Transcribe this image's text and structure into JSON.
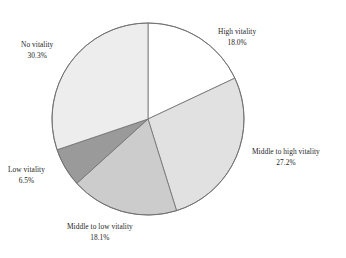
{
  "chart_data": {
    "type": "pie",
    "title": "",
    "subtitle": "",
    "legend_position": "none",
    "grid": false,
    "start_angle_deg": 0,
    "direction": "clockwise",
    "categories": [
      "High vitality",
      "Middle to high vitality",
      "Middle to low vitality",
      "Low vitality",
      "No vitality"
    ],
    "values": [
      18.0,
      27.2,
      18.1,
      6.5,
      30.3
    ],
    "value_unit": "%",
    "slices": [
      {
        "label": "High vitality",
        "percent_text": "18.0%",
        "value": 18.0,
        "color": "#ffffff",
        "start_deg": 0.0,
        "end_deg": 64.8
      },
      {
        "label": "Middle to high vitality",
        "percent_text": "27.2%",
        "value": 27.2,
        "color": "#e1e1e1",
        "start_deg": 64.8,
        "end_deg": 162.7
      },
      {
        "label": "Middle to low vitality",
        "percent_text": "18.1%",
        "value": 18.1,
        "color": "#cccccc",
        "start_deg": 162.7,
        "end_deg": 227.9
      },
      {
        "label": "Low vitality",
        "percent_text": "6.5%",
        "value": 6.5,
        "color": "#9a9a9a",
        "start_deg": 227.9,
        "end_deg": 251.3
      },
      {
        "label": "No vitality",
        "percent_text": "30.3%",
        "value": 30.3,
        "color": "#ededed",
        "start_deg": 251.3,
        "end_deg": 360.0
      }
    ],
    "geometry": {
      "center_x": 148,
      "center_y": 119,
      "radius": 96
    },
    "style": {
      "outline_color": "#6e6e6e",
      "background": "#ffffff",
      "text_color": "#262626"
    }
  }
}
